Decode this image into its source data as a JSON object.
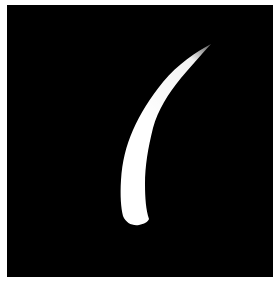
{
  "image": {
    "subject": "white curved horn-shaped silhouette",
    "background_color": "#000000",
    "shape_color": "#ffffff",
    "border_color": "#ffffff"
  }
}
